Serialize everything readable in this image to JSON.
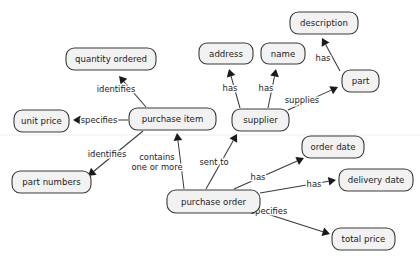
{
  "diagram": {
    "type": "concept-map",
    "background_color": "#ffffff",
    "node_fill": "#f2f2f2",
    "node_stroke": "#3a3a3a",
    "text_color": "#1a1a1a",
    "nodes": [
      {
        "id": "description",
        "label": "description",
        "x": 290,
        "y": 12,
        "w": 68,
        "h": 22
      },
      {
        "id": "address",
        "label": "address",
        "x": 199,
        "y": 43,
        "w": 54,
        "h": 21
      },
      {
        "id": "name",
        "label": "name",
        "x": 261,
        "y": 43,
        "w": 44,
        "h": 21
      },
      {
        "id": "quantity",
        "label": "quantity ordered",
        "x": 66,
        "y": 48,
        "w": 90,
        "h": 22
      },
      {
        "id": "part",
        "label": "part",
        "x": 342,
        "y": 70,
        "w": 37,
        "h": 22
      },
      {
        "id": "unit_price",
        "label": "unit price",
        "x": 14,
        "y": 110,
        "w": 55,
        "h": 22
      },
      {
        "id": "purchase_item",
        "label": "purchase item",
        "x": 129,
        "y": 108,
        "w": 87,
        "h": 22
      },
      {
        "id": "supplier",
        "label": "supplier",
        "x": 232,
        "y": 109,
        "w": 57,
        "h": 22
      },
      {
        "id": "order_date",
        "label": "order date",
        "x": 302,
        "y": 136,
        "w": 62,
        "h": 22
      },
      {
        "id": "delivery_date",
        "label": "delivery date",
        "x": 339,
        "y": 169,
        "w": 74,
        "h": 22
      },
      {
        "id": "part_numbers",
        "label": "part numbers",
        "x": 12,
        "y": 171,
        "w": 79,
        "h": 22
      },
      {
        "id": "purchase_order",
        "label": "purchase order",
        "x": 167,
        "y": 190,
        "w": 93,
        "h": 23
      },
      {
        "id": "total_price",
        "label": "total price",
        "x": 332,
        "y": 228,
        "w": 63,
        "h": 22
      }
    ],
    "edges": [
      {
        "id": "e-item-quantity",
        "from": "purchase_item",
        "to": "quantity",
        "label": "identifies",
        "label_x": 116,
        "label_y": 89,
        "x1": 146,
        "y1": 107,
        "x2": 119,
        "y2": 76,
        "head": true
      },
      {
        "id": "e-item-unitprice",
        "from": "purchase_item",
        "to": "unit_price",
        "label": "specifies",
        "label_x": 99,
        "label_y": 120,
        "x1": 128,
        "y1": 120,
        "x2": 73,
        "y2": 120,
        "head": true
      },
      {
        "id": "e-item-partnum",
        "from": "purchase_item",
        "to": "part_numbers",
        "label": "identifies",
        "label_x": 107,
        "label_y": 154,
        "x1": 143,
        "y1": 131,
        "x2": 88,
        "y2": 176,
        "head": true
      },
      {
        "id": "e-order-item",
        "from": "purchase_order",
        "to": "purchase_item",
        "label": "contains\none or more",
        "label_x": 157,
        "label_y": 162,
        "x1": 184,
        "y1": 189,
        "x2": 177,
        "y2": 133,
        "head": true
      },
      {
        "id": "e-order-supplier",
        "from": "purchase_order",
        "to": "supplier",
        "label": "sent to",
        "label_x": 214,
        "label_y": 162,
        "x1": 206,
        "y1": 189,
        "x2": 237,
        "y2": 134,
        "head": true
      },
      {
        "id": "e-supplier-address",
        "from": "supplier",
        "to": "address",
        "label": "has",
        "label_x": 230,
        "label_y": 88,
        "x1": 240,
        "y1": 108,
        "x2": 229,
        "y2": 69,
        "head": true
      },
      {
        "id": "e-supplier-name",
        "from": "supplier",
        "to": "name",
        "label": "has",
        "label_x": 266,
        "label_y": 88,
        "x1": 268,
        "y1": 108,
        "x2": 276,
        "y2": 69,
        "head": true
      },
      {
        "id": "e-supplier-part",
        "from": "supplier",
        "to": "part",
        "label": "supplies",
        "label_x": 302,
        "label_y": 100,
        "x1": 288,
        "y1": 110,
        "x2": 338,
        "y2": 87,
        "head": true
      },
      {
        "id": "e-part-description",
        "from": "part",
        "to": "description",
        "label": "has",
        "label_x": 323,
        "label_y": 58,
        "x1": 340,
        "y1": 71,
        "x2": 322,
        "y2": 38,
        "head": true
      },
      {
        "id": "e-order-orderdate",
        "from": "purchase_order",
        "to": "order_date",
        "label": "has",
        "label_x": 258,
        "label_y": 177,
        "x1": 234,
        "y1": 189,
        "x2": 304,
        "y2": 158,
        "head": true
      },
      {
        "id": "e-order-delivery",
        "from": "purchase_order",
        "to": "delivery_date",
        "label": "has",
        "label_x": 314,
        "label_y": 184,
        "x1": 260,
        "y1": 193,
        "x2": 336,
        "y2": 180,
        "head": true
      },
      {
        "id": "e-order-totalprice",
        "from": "purchase_order",
        "to": "total_price",
        "label": "specifies",
        "label_x": 269,
        "label_y": 211,
        "x1": 258,
        "y1": 211,
        "x2": 330,
        "y2": 234,
        "head": true
      }
    ]
  }
}
